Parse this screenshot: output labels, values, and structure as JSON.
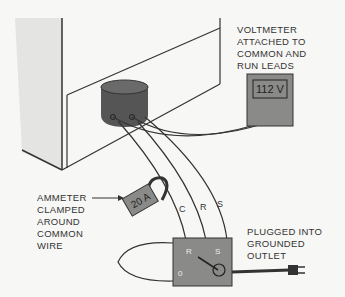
{
  "diagram": {
    "labels": {
      "voltmeter": [
        "VOLTMETER",
        "ATTACHED TO",
        "COMMON AND",
        "RUN LEADS"
      ],
      "ammeter": [
        "AMMETER",
        "CLAMPED",
        "AROUND",
        "COMMON",
        "WIRE"
      ],
      "outlet": [
        "PLUGGED INTO",
        "GROUNDED",
        "OUTLET"
      ]
    },
    "voltmeter_reading": "112 V",
    "ammeter_reading": "20 A",
    "wires": [
      "C",
      "R",
      "S"
    ],
    "switch_box": {
      "terminal_r": "R",
      "terminal_s": "S",
      "position_label": "0"
    },
    "colors": {
      "background": "#f7f7f5",
      "line": "#333333",
      "compressor": "#555555",
      "meter_fill": "#8a8a88",
      "cabinet_side": "#e6e6e4"
    }
  }
}
